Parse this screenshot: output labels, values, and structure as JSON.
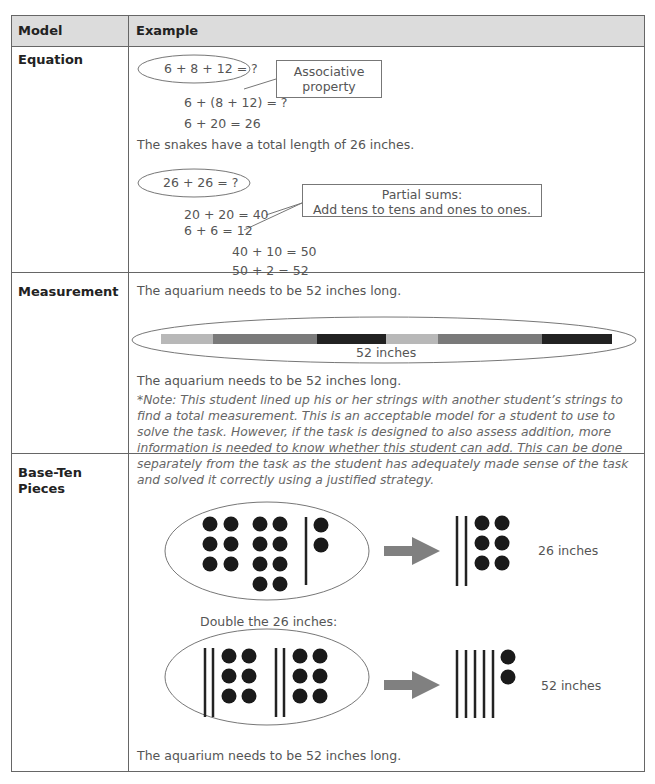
{
  "header": {
    "col_model": "Model",
    "col_example": "Example"
  },
  "rows": {
    "equation": {
      "label": "Equation",
      "eq1": "6 + 8 + 12 = ?",
      "callout1_line1": "Associative",
      "callout1_line2": "property",
      "step1": "6 + (8 + 12) = ?",
      "step2": "6 + 20 = 26",
      "result1": "The snakes have a total length of 26 inches.",
      "eq2": "26 + 26 = ?",
      "callout2_line1": "Partial sums:",
      "callout2_line2": "Add tens to tens and ones to ones.",
      "step3": "20 + 20 = 40",
      "step4": "6 + 6 = 12",
      "step5": "40 + 10 = 50",
      "step6": "50 + 2 = 52",
      "result2": "The aquarium needs to be 52 inches long."
    },
    "measurement": {
      "label": "Measurement",
      "strip_label": "52 inches",
      "strip_colors": [
        "#b8b8b8",
        "#7a7a7a",
        "#222222",
        "#b8b8b8",
        "#7a7a7a",
        "#222222"
      ],
      "result": "The aquarium needs to be 52 inches long.",
      "note": "*Note: This student lined up his or her strings with another student’s strings to find a total measurement. This is an acceptable model for a student to use to solve the task. However, if the task is designed to also assess addition, more information is needed to know whether this student can add. This can be done separately from the task as the student has adequately made sense of the task and solved it correctly using a justified strategy."
    },
    "base_ten": {
      "label_line1": "Base-Ten",
      "label_line2": "Pieces",
      "result_top": "26 inches",
      "double_caption": "Double the 26 inches:",
      "result_bottom": "52 inches",
      "result": "The aquarium needs to be 52 inches long."
    }
  },
  "colors": {
    "border": "#666666",
    "header_bg": "#dcdcdc",
    "arrow": "#808080",
    "dot": "#1a1a1a"
  }
}
